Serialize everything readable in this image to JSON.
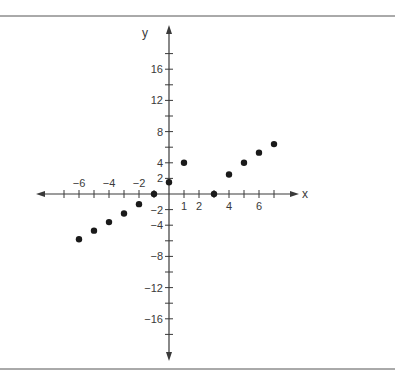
{
  "chart_data": {
    "type": "scatter",
    "title": "",
    "xlabel": "x",
    "ylabel": "y",
    "xlim": [
      -8,
      8.5
    ],
    "ylim": [
      -21,
      21
    ],
    "grid": false,
    "legend": "none",
    "x_ticks": [
      -7,
      -6,
      -5,
      -4,
      -3,
      -2,
      -1,
      0,
      1,
      2,
      3,
      4,
      5,
      6,
      7
    ],
    "x_tick_labels": [
      {
        "value": -6,
        "label": "−6"
      },
      {
        "value": -4,
        "label": "−4"
      },
      {
        "value": -2,
        "label": "−2"
      },
      {
        "value": 1,
        "label": "1"
      },
      {
        "value": 2,
        "label": "2"
      },
      {
        "value": 4,
        "label": "4"
      },
      {
        "value": 6,
        "label": "6"
      }
    ],
    "y_ticks": [
      -18,
      -16,
      -14,
      -12,
      -10,
      -8,
      -6,
      -4,
      -2,
      2,
      4,
      6,
      8,
      10,
      12,
      14,
      16,
      18
    ],
    "y_tick_labels": [
      {
        "value": 16,
        "label": "16"
      },
      {
        "value": 12,
        "label": "12"
      },
      {
        "value": 8,
        "label": "8"
      },
      {
        "value": 4,
        "label": "4"
      },
      {
        "value": 2,
        "label": "2"
      },
      {
        "value": -2,
        "label": "−2"
      },
      {
        "value": -4,
        "label": "−4"
      },
      {
        "value": -8,
        "label": "−8"
      },
      {
        "value": -12,
        "label": "−12"
      },
      {
        "value": -16,
        "label": "−16"
      }
    ],
    "series": [
      {
        "name": "points",
        "points": [
          {
            "x": -6,
            "y": -5.8
          },
          {
            "x": -5,
            "y": -4.7
          },
          {
            "x": -4,
            "y": -3.6
          },
          {
            "x": -3,
            "y": -2.5
          },
          {
            "x": -2,
            "y": -1.3
          },
          {
            "x": -1,
            "y": 0
          },
          {
            "x": 0,
            "y": 1.5
          },
          {
            "x": 1,
            "y": 4
          },
          {
            "x": 3,
            "y": 0
          },
          {
            "x": 4,
            "y": 2.5
          },
          {
            "x": 5,
            "y": 4
          },
          {
            "x": 6,
            "y": 5.3
          },
          {
            "x": 7,
            "y": 6.4
          }
        ]
      }
    ],
    "colors": {
      "axis": "#3a3a3a",
      "point": "#1a1a1a",
      "frame": "#555555"
    }
  }
}
